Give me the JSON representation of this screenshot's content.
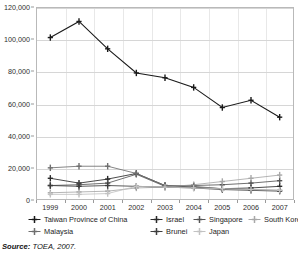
{
  "source_note": {
    "label": "Source:",
    "text": "TOEA, 2007."
  },
  "chart_data": {
    "type": "line",
    "title": "",
    "xlabel": "",
    "ylabel": "",
    "ylim": [
      0,
      120000
    ],
    "ytick_values": [
      0,
      20000,
      40000,
      60000,
      80000,
      100000,
      120000
    ],
    "ytick_labels": [
      "0",
      "20,000",
      "40,000",
      "60,000",
      "80,000",
      "100,000",
      "120,000"
    ],
    "grid": true,
    "legend_position": "bottom",
    "categories": [
      "1999",
      "2000",
      "2001",
      "2002",
      "2003",
      "2004",
      "2005",
      "2006",
      "2007"
    ],
    "series": [
      {
        "name": "Taiwan Province of China",
        "color": "#1a1a1a",
        "marker": "plus",
        "values": [
          101000,
          111000,
          94000,
          79000,
          76000,
          70000,
          57500,
          62000,
          51500
        ]
      },
      {
        "name": "Israel",
        "color": "#2b2b2b",
        "marker": "plus",
        "values": [
          13500,
          10500,
          13000,
          16500,
          9000,
          8000,
          7000,
          7500,
          8500
        ]
      },
      {
        "name": "Singapore",
        "color": "#555555",
        "marker": "plus",
        "values": [
          9000,
          9500,
          10500,
          16000,
          8500,
          9000,
          9500,
          10500,
          12000
        ]
      },
      {
        "name": "South Korea",
        "color": "#a8a8a8",
        "marker": "plus",
        "values": [
          4500,
          5000,
          5500,
          7500,
          8000,
          9500,
          11500,
          13500,
          15500
        ]
      },
      {
        "name": "Malaysia",
        "color": "#6f6f6f",
        "marker": "plus",
        "values": [
          20000,
          21000,
          21000,
          16500,
          9000,
          8500,
          7000,
          6500,
          6000
        ]
      },
      {
        "name": "Brunei",
        "color": "#3d3d3d",
        "marker": "plus",
        "values": [
          9000,
          8500,
          9000,
          8500,
          8000,
          7500,
          6500,
          6000,
          5500
        ]
      },
      {
        "name": "Japan",
        "color": "#c2c2c2",
        "marker": "plus",
        "values": [
          3500,
          3500,
          4000,
          8500,
          8000,
          7500,
          7000,
          6500,
          6000
        ]
      }
    ]
  }
}
